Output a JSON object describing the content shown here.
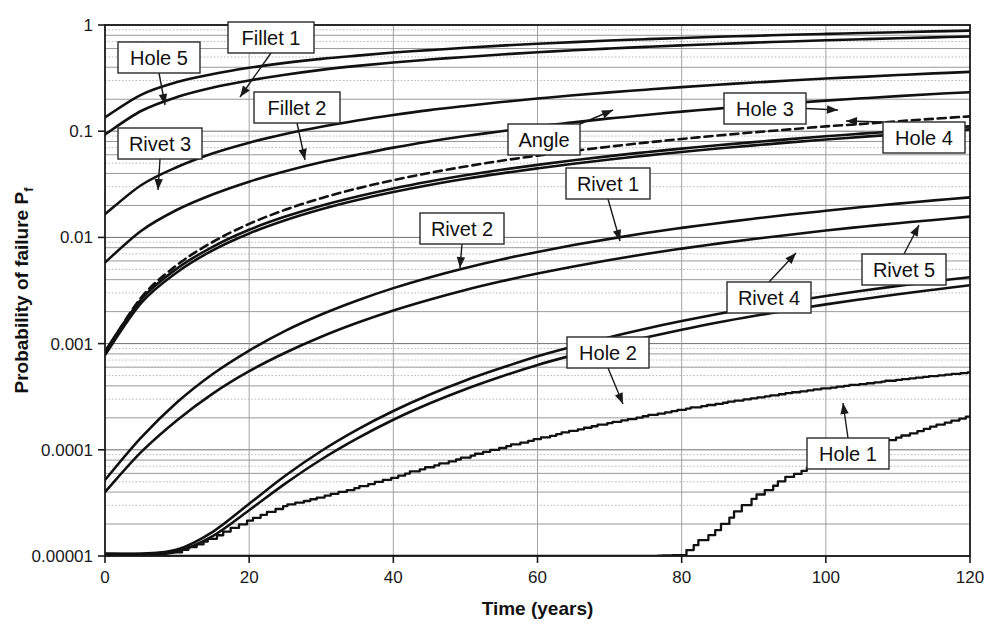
{
  "chart_data": {
    "type": "line",
    "title": "",
    "xlabel": "Time (years)",
    "ylabel": "Probability of failure P",
    "ylabel_sub": "f",
    "xlim": [
      0,
      120
    ],
    "ylim": [
      1e-05,
      1
    ],
    "yscale": "log",
    "xscale": "linear",
    "grid": true,
    "grid_minor": true,
    "legend_position": "inline-callouts",
    "xticks": [
      0,
      20,
      40,
      60,
      80,
      100,
      120
    ],
    "xtick_labels": [
      "0",
      "20",
      "40",
      "60",
      "80",
      "100",
      "120"
    ],
    "yticks": [
      1,
      0.1,
      0.01,
      0.001,
      0.0001,
      1e-05
    ],
    "ytick_labels": [
      "1",
      "0.1",
      "0.01",
      "0.001",
      "0.0001",
      "0.00001"
    ],
    "x": [
      0,
      5,
      10,
      15,
      20,
      25,
      30,
      35,
      40,
      45,
      50,
      55,
      60,
      65,
      70,
      75,
      80,
      85,
      90,
      95,
      100,
      105,
      110,
      115,
      120
    ],
    "series": [
      {
        "name": "Hole 5",
        "style": "solid",
        "label_x": 22,
        "label_y": 0.47,
        "values": [
          0.135,
          0.22,
          0.29,
          0.345,
          0.395,
          0.44,
          0.48,
          0.515,
          0.55,
          0.58,
          0.61,
          0.64,
          0.665,
          0.69,
          0.715,
          0.735,
          0.755,
          0.775,
          0.79,
          0.81,
          0.825,
          0.84,
          0.855,
          0.87,
          0.885
        ]
      },
      {
        "name": "Fillet 1",
        "style": "solid",
        "label_x": 42,
        "label_y": 0.72,
        "values": [
          0.093,
          0.155,
          0.21,
          0.258,
          0.3,
          0.34,
          0.378,
          0.412,
          0.443,
          0.473,
          0.5,
          0.528,
          0.553,
          0.578,
          0.6,
          0.622,
          0.643,
          0.663,
          0.682,
          0.7,
          0.718,
          0.735,
          0.75,
          0.765,
          0.78
        ]
      },
      {
        "name": "Fillet 2",
        "style": "solid",
        "label_x": 40,
        "label_y": 0.16,
        "values": [
          0.0165,
          0.031,
          0.046,
          0.062,
          0.078,
          0.094,
          0.11,
          0.126,
          0.142,
          0.158,
          0.173,
          0.188,
          0.203,
          0.218,
          0.232,
          0.246,
          0.26,
          0.274,
          0.287,
          0.3,
          0.313,
          0.325,
          0.338,
          0.35,
          0.362
        ]
      },
      {
        "name": "Rivet 3",
        "style": "solid",
        "label_x": 13,
        "label_y": 0.12,
        "values": [
          0.0058,
          0.0115,
          0.0182,
          0.0255,
          0.0335,
          0.042,
          0.051,
          0.06,
          0.07,
          0.08,
          0.09,
          0.1,
          0.111,
          0.121,
          0.132,
          0.142,
          0.153,
          0.163,
          0.174,
          0.184,
          0.194,
          0.204,
          0.214,
          0.224,
          0.233
        ]
      },
      {
        "name": "Angle",
        "style": "dashed",
        "label_x": 56,
        "label_y": 0.088,
        "values": [
          0.00082,
          0.0027,
          0.0055,
          0.0091,
          0.0134,
          0.0182,
          0.0234,
          0.0289,
          0.0346,
          0.0405,
          0.0465,
          0.0527,
          0.0589,
          0.0652,
          0.0716,
          0.078,
          0.0845,
          0.091,
          0.0975,
          0.104,
          0.111,
          0.117,
          0.124,
          0.131,
          0.138
        ]
      },
      {
        "name": "Hole 3",
        "style": "solid",
        "label_x": 96,
        "label_y": 0.125,
        "values": [
          0.00085,
          0.0026,
          0.0051,
          0.0082,
          0.0118,
          0.0157,
          0.0199,
          0.0243,
          0.0289,
          0.0336,
          0.0384,
          0.0433,
          0.0482,
          0.0532,
          0.0583,
          0.0634,
          0.0685,
          0.0737,
          0.0789,
          0.0842,
          0.0895,
          0.0948,
          0.1,
          0.106,
          0.111
        ]
      },
      {
        "name": "Hole 4",
        "style": "solid",
        "label_x": 112,
        "label_y": 0.095,
        "values": [
          0.00078,
          0.0024,
          0.0047,
          0.0076,
          0.0109,
          0.0145,
          0.0184,
          0.0225,
          0.0267,
          0.0311,
          0.0356,
          0.0401,
          0.0447,
          0.0494,
          0.0541,
          0.0589,
          0.0637,
          0.0686,
          0.0735,
          0.0784,
          0.0834,
          0.0884,
          0.0934,
          0.0985,
          0.104
        ]
      },
      {
        "name": "Rivet 1",
        "style": "solid",
        "label_x": 64,
        "label_y": 0.017,
        "values": [
          5.2e-05,
          0.00013,
          0.00028,
          0.00052,
          0.00086,
          0.00132,
          0.00188,
          0.00255,
          0.00333,
          0.0042,
          0.00516,
          0.0062,
          0.0073,
          0.00847,
          0.00969,
          0.011,
          0.0123,
          0.0136,
          0.015,
          0.0164,
          0.0178,
          0.0193,
          0.0208,
          0.0223,
          0.0238
        ]
      },
      {
        "name": "Rivet 2",
        "style": "solid",
        "label_x": 48,
        "label_y": 0.0115,
        "values": [
          4e-05,
          9.5e-05,
          0.00019,
          0.00034,
          0.00055,
          0.00082,
          0.00116,
          0.00157,
          0.00205,
          0.00259,
          0.0032,
          0.00386,
          0.00457,
          0.00533,
          0.00613,
          0.00697,
          0.00784,
          0.00874,
          0.00966,
          0.0106,
          0.0116,
          0.0126,
          0.0136,
          0.0146,
          0.0157
        ]
      },
      {
        "name": "Rivet 4",
        "style": "solid",
        "label_x": 77,
        "label_y": 0.0028,
        "values": [
          1.05e-05,
          1.05e-05,
          1.15e-05,
          1.7e-05,
          3.1e-05,
          5.7e-05,
          9.75e-05,
          0.000155,
          0.000232,
          0.00033,
          0.00045,
          0.00059,
          0.00076,
          0.00094,
          0.00115,
          0.00138,
          0.00163,
          0.0019,
          0.00219,
          0.00249,
          0.00281,
          0.00314,
          0.00349,
          0.00385,
          0.00422
        ]
      },
      {
        "name": "Rivet 5",
        "style": "solid",
        "label_x": 107,
        "label_y": 0.0055,
        "values": [
          1e-05,
          1e-05,
          1.1e-05,
          1.55e-05,
          2.7e-05,
          4.8e-05,
          8.1e-05,
          0.000128,
          0.000192,
          0.000273,
          0.000372,
          0.00049,
          0.00063,
          0.00078,
          0.00095,
          0.00114,
          0.00135,
          0.00158,
          0.00182,
          0.00207,
          0.00234,
          0.00262,
          0.00291,
          0.00322,
          0.00354
        ]
      },
      {
        "name": "Hole 2",
        "style": "stepped",
        "label_x": 60,
        "label_y": 0.00065,
        "values": [
          1.05e-05,
          1.05e-05,
          1.08e-05,
          1.45e-05,
          2.15e-05,
          2.95e-05,
          3.55e-05,
          4.35e-05,
          5.45e-05,
          6.85e-05,
          8.45e-05,
          0.000104,
          0.000126,
          0.000151,
          0.000178,
          0.000207,
          0.000238,
          0.000271,
          0.000305,
          0.000341,
          0.000378,
          0.000416,
          0.000455,
          0.000495,
          0.000535
        ]
      },
      {
        "name": "Hole 1",
        "style": "stepped",
        "label_x": 96,
        "label_y": 0.000118,
        "values": [
          1e-05,
          1e-05,
          1e-05,
          1e-05,
          1e-05,
          1e-05,
          1e-05,
          1e-05,
          1e-05,
          1e-05,
          1e-05,
          1e-05,
          1e-05,
          1e-05,
          1e-05,
          1e-05,
          1.02e-05,
          1.75e-05,
          3.45e-05,
          5.55e-05,
          7.75e-05,
          0.0001,
          0.00013,
          0.000165,
          0.000205
        ]
      }
    ],
    "callouts": [
      {
        "label": "Hole 5",
        "box_x": 118,
        "box_y": 42,
        "box_w": 82,
        "box_h": 31,
        "tip_x": 165,
        "tip_y": 105
      },
      {
        "label": "Fillet 1",
        "box_x": 228,
        "box_y": 22,
        "box_w": 86,
        "box_h": 31,
        "tip_x": 240,
        "tip_y": 97
      },
      {
        "label": "Fillet 2",
        "box_x": 254,
        "box_y": 92,
        "box_w": 86,
        "box_h": 31,
        "tip_x": 305,
        "tip_y": 160
      },
      {
        "label": "Rivet 3",
        "box_x": 118,
        "box_y": 128,
        "box_w": 84,
        "box_h": 31,
        "tip_x": 158,
        "tip_y": 190
      },
      {
        "label": "Angle",
        "box_x": 508,
        "box_y": 124,
        "box_w": 72,
        "box_h": 31,
        "tip_x": 613,
        "tip_y": 110
      },
      {
        "label": "Hole 3",
        "box_x": 724,
        "box_y": 93,
        "box_w": 82,
        "box_h": 31,
        "tip_x": 838,
        "tip_y": 110
      },
      {
        "label": "Hole 4",
        "box_x": 883,
        "box_y": 122,
        "box_w": 82,
        "box_h": 31,
        "tip_x": 846,
        "tip_y": 121
      },
      {
        "label": "Rivet 1",
        "box_x": 566,
        "box_y": 168,
        "box_w": 84,
        "box_h": 31,
        "tip_x": 620,
        "tip_y": 241
      },
      {
        "label": "Rivet 2",
        "box_x": 420,
        "box_y": 213,
        "box_w": 84,
        "box_h": 31,
        "tip_x": 460,
        "tip_y": 268
      },
      {
        "label": "Rivet 4",
        "box_x": 727,
        "box_y": 282,
        "box_w": 84,
        "box_h": 31,
        "tip_x": 796,
        "tip_y": 253
      },
      {
        "label": "Rivet 5",
        "box_x": 862,
        "box_y": 254,
        "box_w": 84,
        "box_h": 31,
        "tip_x": 919,
        "tip_y": 225
      },
      {
        "label": "Hole 2",
        "box_x": 567,
        "box_y": 337,
        "box_w": 82,
        "box_h": 31,
        "tip_x": 623,
        "tip_y": 404
      },
      {
        "label": "Hole 1",
        "box_x": 807,
        "box_y": 438,
        "box_w": 82,
        "box_h": 31,
        "tip_x": 843,
        "tip_y": 403
      }
    ]
  }
}
